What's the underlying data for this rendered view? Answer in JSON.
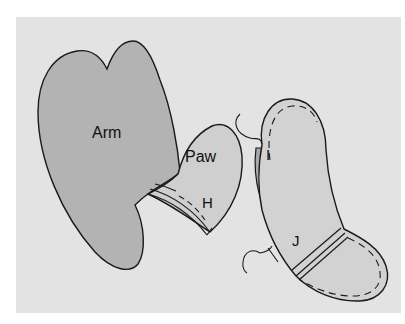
{
  "diagram": {
    "type": "sewing-pattern-illustration",
    "background_color": "#e3e3e3",
    "colors": {
      "arm_fill": "#b3b3b3",
      "paw_fill": "#cfcfcf",
      "leg_fill": "#d2d2d2",
      "leg_inner_fill": "#a9a9a9",
      "outline": "#1a1a1a"
    },
    "pieces": [
      {
        "id": "arm",
        "label": "Arm"
      },
      {
        "id": "paw",
        "label": "Paw"
      },
      {
        "id": "leg",
        "label": ""
      }
    ],
    "markers": [
      {
        "id": "H",
        "label": "H"
      },
      {
        "id": "I",
        "label": "I"
      },
      {
        "id": "J",
        "label": "J"
      }
    ]
  }
}
